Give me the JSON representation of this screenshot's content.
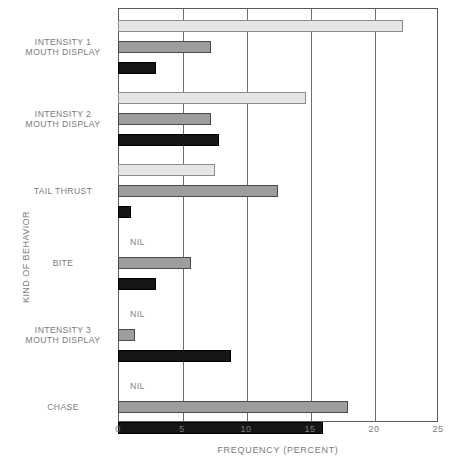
{
  "chart_data": {
    "type": "bar",
    "orientation": "horizontal",
    "title": "",
    "xlabel": "FREQUENCY (PERCENT)",
    "ylabel": "KIND OF BEHAVIOR",
    "xlim": [
      0,
      25
    ],
    "ylim": null,
    "xticks": [
      0,
      5,
      10,
      15,
      20,
      25
    ],
    "xtick_labels": [
      "0",
      "5",
      "10",
      "15",
      "20",
      "25"
    ],
    "grid": "vertical",
    "legend": "none",
    "nil_label": "NIL",
    "categories": [
      "INTENSITY 1 MOUTH DISPLAY",
      "INTENSITY 2 MOUTH DISPLAY",
      "TAIL THRUST",
      "BITE",
      "INTENSITY 3 MOUTH DISPLAY",
      "CHASE"
    ],
    "category_lines": [
      [
        "INTENSITY 1",
        "MOUTH DISPLAY"
      ],
      [
        "INTENSITY 2",
        "MOUTH DISPLAY"
      ],
      [
        "TAIL THRUST"
      ],
      [
        "BITE"
      ],
      [
        "INTENSITY 3",
        "MOUTH DISPLAY"
      ],
      [
        "CHASE"
      ]
    ],
    "series": [
      {
        "name": "series-light",
        "color": "#e6e6e6",
        "values": [
          22.3,
          14.7,
          7.6,
          null,
          null,
          null
        ]
      },
      {
        "name": "series-mid-gray",
        "color": "#9d9d9d",
        "values": [
          7.3,
          7.3,
          12.5,
          5.7,
          1.3,
          18.0
        ]
      },
      {
        "name": "series-dark",
        "color": "#161616",
        "values": [
          3.0,
          7.9,
          1.0,
          3.0,
          8.8,
          16.0
        ]
      }
    ]
  }
}
